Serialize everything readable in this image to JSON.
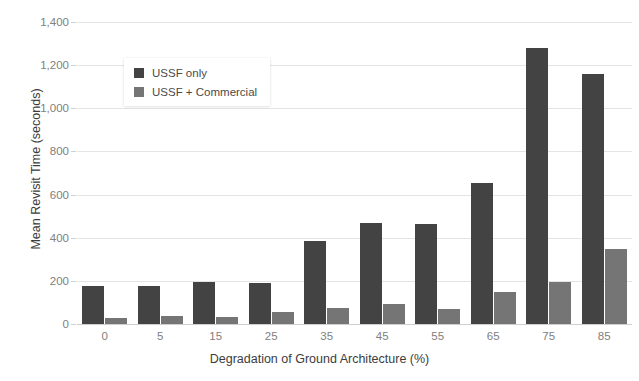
{
  "chart_data": {
    "type": "bar",
    "title": "",
    "xlabel": "Degradation of Ground Architecture (%)",
    "ylabel": "Mean Revisit Time (seconds)",
    "categories": [
      "0",
      "5",
      "15",
      "25",
      "35",
      "45",
      "55",
      "65",
      "75",
      "85"
    ],
    "series": [
      {
        "name": "USSF only",
        "color": "#434343",
        "values": [
          175,
          175,
          195,
          192,
          385,
          470,
          465,
          655,
          1280,
          1160
        ]
      },
      {
        "name": "USSF + Commercial",
        "color": "#757575",
        "values": [
          30,
          38,
          32,
          58,
          72,
          92,
          70,
          148,
          195,
          350
        ]
      }
    ],
    "ylim": [
      0,
      1400
    ],
    "ytick_values": [
      0,
      200,
      400,
      600,
      800,
      1000,
      1200,
      1400
    ],
    "ytick_labels": [
      "0",
      "200",
      "400",
      "600",
      "800",
      "1,000",
      "1,200",
      "1,400"
    ],
    "grid": true,
    "legend_position": "upper-left-inset"
  },
  "legend": {
    "items": [
      {
        "label": "USSF only",
        "color": "#434343"
      },
      {
        "label": "USSF + Commercial",
        "color": "#757575"
      }
    ]
  },
  "colors": {
    "series_dark": "#434343",
    "series_light": "#757575",
    "gridline": "#e4e4e4",
    "axis": "#cfcfcf",
    "tick_text": "#808080",
    "axis_title_text": "#3c3c3c",
    "background": "#ffffff"
  }
}
